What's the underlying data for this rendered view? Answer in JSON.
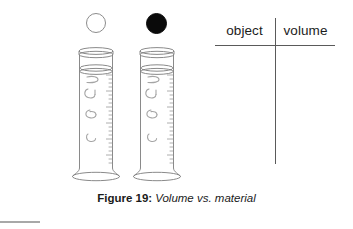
{
  "figure": {
    "caption_label": "Figure 19:",
    "caption_title": "Volume vs. material",
    "background_color": "#ffffff",
    "line_color": "#5a5a5a"
  },
  "specimens": [
    {
      "name": "hollow-sphere",
      "fill": "white",
      "fill_color": "#ffffff",
      "outline_color": "#8c8c8c"
    },
    {
      "name": "solid-sphere",
      "fill": "black",
      "fill_color": "#0a0a0a",
      "outline_color": "#0a0a0a"
    }
  ],
  "cylinders": [
    {
      "name": "graduated-cylinder-left",
      "liquid_level_label": "",
      "graduation_color": "#8f8f8f",
      "glass_color": "#7d7d7d"
    },
    {
      "name": "graduated-cylinder-right",
      "liquid_level_label": "",
      "graduation_color": "#8f8f8f",
      "glass_color": "#7d7d7d"
    }
  ],
  "table": {
    "columns": [
      {
        "header": "object"
      },
      {
        "header": "volume"
      }
    ],
    "rows": []
  }
}
